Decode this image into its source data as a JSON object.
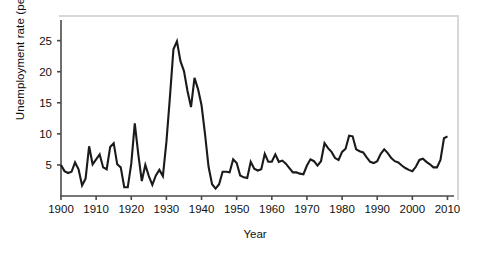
{
  "chart_data": {
    "type": "line",
    "title": "",
    "xlabel": "Year",
    "ylabel": "Unemployment rate (percent)",
    "xlim": [
      1900,
      2011
    ],
    "ylim": [
      0,
      28
    ],
    "xticks": [
      1900,
      1910,
      1920,
      1930,
      1940,
      1950,
      1960,
      1970,
      1980,
      1990,
      2000,
      2010
    ],
    "xtick_labels": [
      "1900",
      "1910",
      "1920",
      "1930",
      "1940",
      "1950",
      "1960",
      "1970",
      "1980",
      "1990",
      "2000",
      "2010"
    ],
    "yticks": [
      5,
      10,
      15,
      20,
      25
    ],
    "ytick_labels": [
      "5",
      "10",
      "15",
      "20",
      "25"
    ],
    "grid": false,
    "legend": false,
    "line_color": "#1a1a1a",
    "line_width": 2.1,
    "series": [
      {
        "name": "Unemployment rate",
        "x": [
          1900,
          1901,
          1902,
          1903,
          1904,
          1905,
          1906,
          1907,
          1908,
          1909,
          1910,
          1911,
          1912,
          1913,
          1914,
          1915,
          1916,
          1917,
          1918,
          1919,
          1920,
          1921,
          1922,
          1923,
          1924,
          1925,
          1926,
          1927,
          1928,
          1929,
          1930,
          1931,
          1932,
          1933,
          1934,
          1935,
          1936,
          1937,
          1938,
          1939,
          1940,
          1941,
          1942,
          1943,
          1944,
          1945,
          1946,
          1947,
          1948,
          1949,
          1950,
          1951,
          1952,
          1953,
          1954,
          1955,
          1956,
          1957,
          1958,
          1959,
          1960,
          1961,
          1962,
          1963,
          1964,
          1965,
          1966,
          1967,
          1968,
          1969,
          1970,
          1971,
          1972,
          1973,
          1974,
          1975,
          1976,
          1977,
          1978,
          1979,
          1980,
          1981,
          1982,
          1983,
          1984,
          1985,
          1986,
          1987,
          1988,
          1989,
          1990,
          1991,
          1992,
          1993,
          1994,
          1995,
          1996,
          1997,
          1998,
          1999,
          2000,
          2001,
          2002,
          2003,
          2004,
          2005,
          2006,
          2007,
          2008,
          2009,
          2010
        ],
        "values": [
          5.0,
          4.0,
          3.7,
          3.9,
          5.4,
          4.3,
          1.7,
          2.8,
          8.0,
          5.1,
          5.9,
          6.7,
          4.6,
          4.3,
          7.9,
          8.5,
          5.1,
          4.6,
          1.4,
          1.4,
          5.2,
          11.7,
          6.7,
          2.4,
          5.0,
          3.2,
          1.8,
          3.3,
          4.2,
          3.2,
          8.7,
          15.9,
          23.6,
          24.9,
          21.7,
          20.1,
          16.9,
          14.3,
          19.0,
          17.2,
          14.6,
          9.9,
          4.7,
          1.9,
          1.2,
          1.9,
          3.9,
          3.9,
          3.8,
          5.9,
          5.3,
          3.3,
          3.0,
          2.9,
          5.5,
          4.4,
          4.1,
          4.3,
          6.8,
          5.5,
          5.5,
          6.7,
          5.5,
          5.7,
          5.2,
          4.5,
          3.8,
          3.8,
          3.6,
          3.5,
          4.9,
          5.9,
          5.6,
          4.9,
          5.6,
          8.5,
          7.7,
          7.1,
          6.1,
          5.8,
          7.1,
          7.6,
          9.7,
          9.6,
          7.5,
          7.2,
          7.0,
          6.2,
          5.5,
          5.3,
          5.6,
          6.8,
          7.5,
          6.9,
          6.1,
          5.6,
          5.4,
          4.9,
          4.5,
          4.2,
          4.0,
          4.7,
          5.8,
          6.0,
          5.5,
          5.1,
          4.6,
          4.6,
          5.8,
          9.3,
          9.6
        ]
      }
    ]
  },
  "axes": {
    "y_axis_name": "y-axis",
    "x_axis_name": "x-axis"
  }
}
